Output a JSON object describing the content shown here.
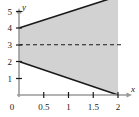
{
  "chart_data": {
    "type": "area",
    "title": "",
    "xlabel": "x",
    "ylabel": "y",
    "xlim": [
      0,
      2.15
    ],
    "ylim": [
      0,
      6.3
    ],
    "grid": false,
    "legend": "none",
    "x_ticks": [
      0,
      0.5,
      1,
      1.5,
      2
    ],
    "x_tick_labels": [
      "0",
      "0.5",
      "1",
      "1.5",
      "2"
    ],
    "y_ticks": [
      1,
      2,
      3,
      4,
      5
    ],
    "y_tick_labels": [
      "1",
      "2",
      "3",
      "4",
      "5"
    ],
    "origin_label": "0",
    "series": [
      {
        "name": "upper-boundary",
        "style": "solid",
        "color": "#1a1a1a",
        "x": [
          0,
          2
        ],
        "values": [
          4,
          5.9
        ]
      },
      {
        "name": "lower-boundary",
        "style": "solid",
        "color": "#1a1a1a",
        "x": [
          0,
          2
        ],
        "values": [
          2,
          0
        ]
      },
      {
        "name": "asymptote",
        "style": "dashed",
        "color": "#1a1a1a",
        "x": [
          0,
          2
        ],
        "values": [
          3,
          3
        ]
      }
    ],
    "shaded_region": {
      "name": "region-between-boundaries",
      "fill": "#d2d2d2",
      "between": [
        "lower-boundary",
        "upper-boundary"
      ],
      "x_range": [
        0,
        2
      ]
    },
    "annotations": []
  }
}
